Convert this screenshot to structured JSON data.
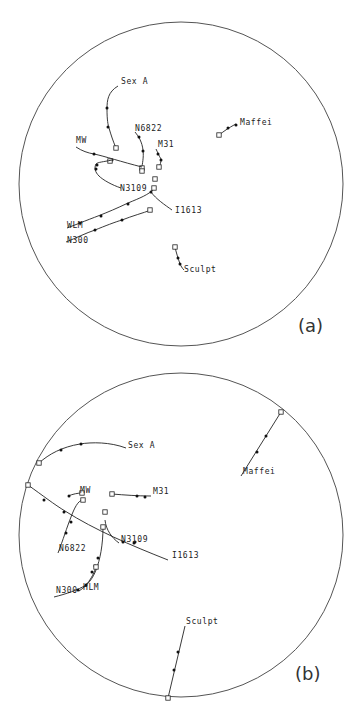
{
  "figure": {
    "panels": [
      {
        "id": "a",
        "label": "(a)",
        "circle": {
          "cx": 181,
          "cy": 184,
          "r": 162
        },
        "label_pos": [
          298,
          332
        ],
        "tracks": [
          {
            "name": "Sex A",
            "label_pos": [
              121,
              84
            ],
            "path": "M118,86 C108,92 107,100 107,109 C107,120 108,125 109,128 C111,135 113,141 116,148",
            "dots": [
              [
                107,
                108
              ],
              [
                108,
                127
              ]
            ],
            "square": [
              116,
              148
            ]
          },
          {
            "name": "N6822",
            "label_pos": [
              135,
              131
            ],
            "path": "M135,132 C139,137 142,142 143,150 C144,158 142,164 142,168",
            "dots": [
              [
                139,
                137
              ],
              [
                143,
                151
              ]
            ],
            "square": [
              142,
              168
            ]
          },
          {
            "name": "M31",
            "label_pos": [
              158,
              147
            ],
            "path": "M156,149 C158,153 159,156 161,159 C161,163 160,165 159,167",
            "dots": [
              [
                158,
                154
              ],
              [
                161,
                160
              ]
            ],
            "square": [
              159,
              167
            ]
          },
          {
            "name": "MW",
            "label_pos": [
              76,
              143
            ],
            "path": "M76,147 C82,151 88,153 94,154 C104,156 122,162 142,167",
            "dots": [
              [
                94,
                154
              ],
              [
                112,
                160
              ]
            ],
            "square": [
              110,
              161
            ]
          },
          {
            "name": "N3109",
            "label_pos": [
              120,
              191
            ],
            "path": "M121,188 C112,185 103,180 99,176 C95,172 94,168 96,164 C98,162 103,162 112,160",
            "dots": [
              [
                96,
                169
              ],
              [
                97,
                165
              ]
            ],
            "square": [
              142,
              171
            ]
          },
          {
            "name": "I1613",
            "label_pos": [
              175,
              213
            ],
            "path": "M172,210 C165,205 156,199 151,192 L154,187",
            "dots": [
              [
                151,
                192
              ]
            ],
            "square": [
              155,
              179
            ]
          },
          {
            "name": "WLM",
            "label_pos": [
              67,
              228
            ],
            "path": "M67,228 L80,223 C92,218 105,214 128,203 C140,198 148,195 154,189",
            "dots": [
              [
                80,
                223
              ],
              [
                101,
                216
              ],
              [
                128,
                204
              ]
            ],
            "square": [
              154,
              188
            ]
          },
          {
            "name": "N300",
            "label_pos": [
              67,
              243
            ],
            "path": "M66,242 C76,238 86,233 95,230 C105,226 115,222 122,220 C132,216 143,213 151,210",
            "dots": [
              [
                95,
                230
              ],
              [
                122,
                220
              ]
            ],
            "square": [
              150,
              210
            ]
          },
          {
            "name": "Maffei",
            "label_pos": [
              240,
              125
            ],
            "path": "M219,135 C223,132 228,128 236,124",
            "dots": [
              [
                228,
                128
              ],
              [
                236,
                125
              ]
            ],
            "square": [
              219,
              135
            ]
          },
          {
            "name": "Sculpt",
            "label_pos": [
              184,
              272
            ],
            "path": "M175,247 C176,252 178,258 180,264 C181,266 182,268 184,270",
            "dots": [
              [
                178,
                258
              ],
              [
                180,
                264
              ]
            ],
            "square": [
              175,
              247
            ]
          }
        ]
      },
      {
        "id": "b",
        "label": "(b)",
        "circle": {
          "cx": 181,
          "cy": 535,
          "r": 162
        },
        "label_pos": [
          295,
          680
        ],
        "tracks": [
          {
            "name": "Sex A",
            "label_pos": [
              128,
              448
            ],
            "path": "M126,448 C110,442 92,442 80,444 C62,447 49,454 39,463",
            "dots": [
              [
                81,
                444
              ],
              [
                61,
                450
              ]
            ],
            "square": [
              39,
              463
            ]
          },
          {
            "name": "Maffei",
            "label_pos": [
              243,
              474
            ],
            "path": "M241,476 L281,412",
            "dots": [
              [
                266,
                436
              ],
              [
                257,
                452
              ]
            ],
            "square": [
              281,
              412
            ]
          },
          {
            "name": "MW",
            "label_pos": [
              80,
              493
            ],
            "path": "M68,496 C73,494 78,493 82,493",
            "dots": [
              [
                69,
                496
              ]
            ],
            "square": [
              82,
              493
            ]
          },
          {
            "name": "M31",
            "label_pos": [
              153,
              494
            ],
            "path": "M112,494 C125,495 137,496 151,496",
            "dots": [
              [
                137,
                496
              ],
              [
                145,
                497
              ]
            ],
            "square": [
              112,
              494
            ]
          },
          {
            "name": "I1613",
            "label_pos": [
              172,
              558
            ],
            "path": "M28,485 C42,495 55,505 65,511 C95,530 130,545 168,560",
            "dots": [
              [
                44,
                500
              ],
              [
                64,
                512
              ],
              [
                135,
                542
              ]
            ],
            "square": [
              28,
              485
            ]
          },
          {
            "name": "N6822",
            "label_pos": [
              59,
              551
            ],
            "path": "M58,553 C63,540 67,527 71,517 C74,509 78,500 83,500",
            "dots": [
              [
                66,
                533
              ],
              [
                71,
                522
              ]
            ],
            "square": [
              83,
              500
            ]
          },
          {
            "name": "N3109",
            "label_pos": [
              121,
              542
            ],
            "path": "M119,543 C112,538 106,530 105,520",
            "dots": [
              [
                123,
                542
              ],
              [
                134,
                543
              ]
            ],
            "square": [
              105,
              512
            ]
          },
          {
            "name": "HLM",
            "label_pos": [
              83,
              590
            ],
            "path": "M103,527 C103,545 100,560 96,570 C93,578 88,585 79,591",
            "dots": [
              [
                98,
                558
              ],
              [
                95,
                566
              ],
              [
                92,
                572
              ]
            ],
            "square": [
              103,
              527
            ]
          },
          {
            "name": "N300",
            "label_pos": [
              56,
              593
            ],
            "path": "M54,597 C66,594 78,590 86,585 C90,580 93,576 96,567",
            "dots": [
              [
                78,
                590
              ],
              [
                86,
                585
              ]
            ],
            "square": [
              96,
              567
            ]
          },
          {
            "name": "Sculpt",
            "label_pos": [
              186,
              624
            ],
            "path": "M185,626 L168,698",
            "dots": [
              [
                178,
                652
              ],
              [
                174,
                670
              ]
            ],
            "square": [
              168,
              698
            ]
          }
        ]
      }
    ]
  }
}
